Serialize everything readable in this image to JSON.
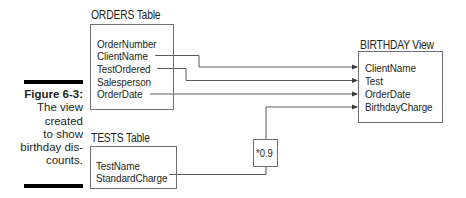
{
  "figure": {
    "label": "Figure 6-3:",
    "caption_lines": [
      "The view",
      "created",
      "to show",
      "birthday dis-",
      "counts."
    ]
  },
  "orders_table": {
    "title": "ORDERS Table",
    "fields": [
      "OrderNumber",
      "ClientName",
      "TestOrdered",
      "Salesperson",
      "OrderDate"
    ]
  },
  "tests_table": {
    "title": "TESTS Table",
    "fields": [
      "TestName",
      "StandardCharge"
    ]
  },
  "birthday_view": {
    "title": "BIRTHDAY View",
    "fields": [
      "ClientName",
      "Test",
      "OrderDate",
      "BirthdayCharge"
    ]
  },
  "multiplier": {
    "label": "*0.9"
  },
  "connections": [
    {
      "from": "ORDERS.ClientName",
      "to": "BIRTHDAY.ClientName"
    },
    {
      "from": "ORDERS.TestOrdered",
      "to": "BIRTHDAY.Test"
    },
    {
      "from": "ORDERS.OrderDate",
      "to": "BIRTHDAY.OrderDate"
    },
    {
      "from": "TESTS.StandardCharge",
      "via": "*0.9",
      "to": "BIRTHDAY.BirthdayCharge"
    }
  ],
  "colors": {
    "line": "#58595b",
    "box_border": "#6d6e71",
    "text": "#231f20",
    "bar": "#000000"
  }
}
